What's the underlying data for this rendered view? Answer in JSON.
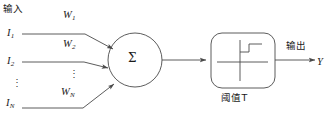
{
  "diagram": {
    "title_semantic": "artificial-neuron-threshold-model",
    "stroke_color": "#4a4a4a",
    "text_color": "#1b1b1b",
    "background": "#ffffff",
    "labels": {
      "input_header": "输入",
      "input_1": "I",
      "input_1_sub": "1",
      "input_2": "I",
      "input_2_sub": "2",
      "input_n": "I",
      "input_n_sub": "N",
      "input_ellipsis": "⋮",
      "weight_1": "W",
      "weight_1_sub": "1",
      "weight_2": "W",
      "weight_2_sub": "2",
      "weight_n": "W",
      "weight_n_sub": "N",
      "weight_ellipsis": "⋮",
      "summation": "Σ",
      "threshold": "阈值T",
      "output_header": "输出",
      "output_symbol": "Y"
    }
  }
}
